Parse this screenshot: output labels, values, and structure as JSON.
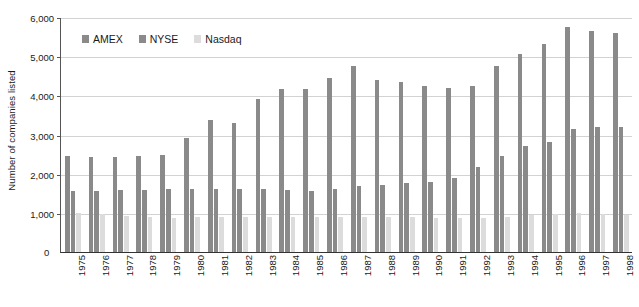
{
  "chart_data": {
    "type": "bar",
    "title": "",
    "xlabel": "",
    "ylabel": "Number of companies listed",
    "ylim": [
      0,
      6000
    ],
    "ytick_values": [
      0,
      1000,
      2000,
      3000,
      4000,
      5000,
      6000
    ],
    "ytick_labels": [
      "0",
      "1,000",
      "2,000",
      "3,000",
      "4,000",
      "5,000",
      "6,000"
    ],
    "grid": true,
    "legend_position": "top-left-inside",
    "categories": [
      "1975",
      "1976",
      "1977",
      "1978",
      "1979",
      "1980",
      "1981",
      "1982",
      "1983",
      "1984",
      "1985",
      "1986",
      "1987",
      "1988",
      "1989",
      "1990",
      "1991",
      "1992",
      "1993",
      "1994",
      "1995",
      "1996",
      "1997",
      "1998"
    ],
    "series": [
      {
        "name": "AMEX",
        "color": "#8a8a8a",
        "values": [
          2450,
          2420,
          2420,
          2440,
          2480,
          2900,
          3380,
          3300,
          3900,
          4150,
          4170,
          4450,
          4750,
          4400,
          4350,
          4250,
          4200,
          4230,
          4750,
          5050,
          5300,
          5750,
          5650,
          5600
        ]
      },
      {
        "name": "NYSE",
        "color": "#8a8a8a",
        "values": [
          1560,
          1570,
          1580,
          1580,
          1600,
          1620,
          1610,
          1600,
          1600,
          1580,
          1560,
          1600,
          1680,
          1720,
          1750,
          1780,
          1880,
          2100,
          2360,
          2580,
          2680,
          3050,
          3100,
          3150
        ]
      },
      {
        "name": "Nasdaq",
        "color": "#dcdcdc",
        "values": [
          1000,
          970,
          920,
          900,
          880,
          900,
          900,
          900,
          900,
          900,
          890,
          890,
          900,
          900,
          900,
          880,
          880,
          880,
          900,
          950,
          980,
          990,
          970,
          950
        ]
      }
    ],
    "bar_overrides": {
      "nyse_display": [
        1560,
        1570,
        1580,
        1580,
        1600,
        1620,
        1610,
        1600,
        1600,
        1580,
        1560,
        1600,
        1680,
        1720,
        1750,
        1780,
        1880,
        2180,
        2440,
        2700,
        2800,
        3150,
        3180,
        3200
      ]
    }
  },
  "legend": {
    "items": [
      {
        "label": "AMEX",
        "color": "#8a8a8a"
      },
      {
        "label": "NYSE",
        "color": "#8a8a8a"
      },
      {
        "label": "Nasdaq",
        "color": "#dcdcdc"
      }
    ]
  },
  "axes": {
    "y_title": "Number of companies listed",
    "zero_label": "0"
  }
}
